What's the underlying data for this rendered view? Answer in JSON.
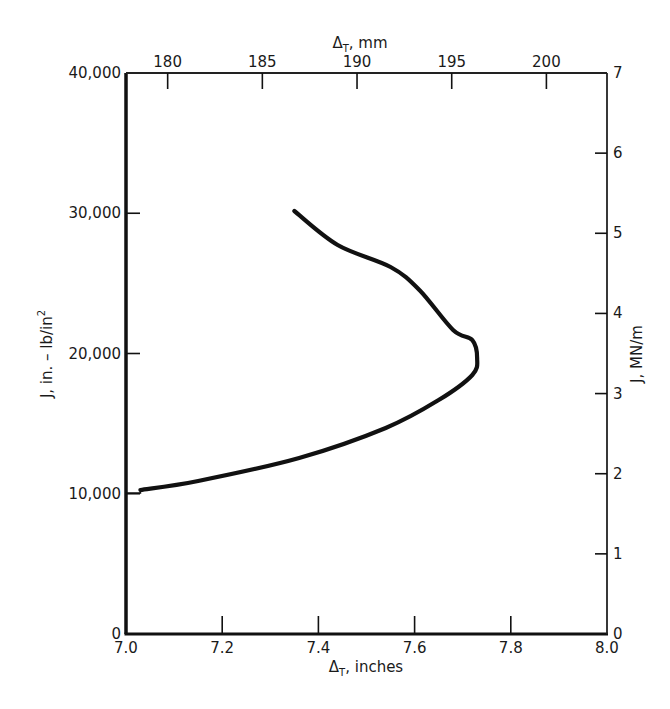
{
  "chart_data": {
    "type": "line",
    "title": "",
    "xlabel": "Δ_T, inches",
    "xlabel_main": "Δ",
    "xlabel_sub": "T",
    "xlabel_unit": ", inches",
    "ylabel": "J, in.-lb/in²",
    "ylabel_text": "J, in. – lb/in",
    "ylabel_sup": "2",
    "x2label": "Δ_T, mm",
    "x2label_main": "Δ",
    "x2label_sub": "T",
    "x2label_unit": ", mm",
    "y2label": "J, MN/m",
    "xlim": [
      7.0,
      8.0
    ],
    "ylim": [
      0,
      40000
    ],
    "x2lim": [
      177.8,
      203.2
    ],
    "y2lim": [
      0,
      7
    ],
    "grid": false,
    "legend": null,
    "x_ticks": [
      "7.0",
      "7.2",
      "7.4",
      "7.6",
      "7.8",
      "8.0"
    ],
    "x_tick_values": [
      7.0,
      7.2,
      7.4,
      7.6,
      7.8,
      8.0
    ],
    "y_ticks": [
      "0",
      "10,000",
      "20,000",
      "30,000",
      "40,000"
    ],
    "y_tick_values": [
      0,
      10000,
      20000,
      30000,
      40000
    ],
    "x2_ticks": [
      "180",
      "185",
      "190",
      "195",
      "200"
    ],
    "x2_tick_values": [
      180,
      185,
      190,
      195,
      200
    ],
    "y2_ticks": [
      "0",
      "1",
      "2",
      "3",
      "4",
      "5",
      "6",
      "7"
    ],
    "y2_tick_values": [
      0,
      1,
      2,
      3,
      4,
      5,
      6,
      7
    ],
    "series": [
      {
        "name": "J vs Δ_T",
        "color": "#111111",
        "x": [
          7.0,
          7.03,
          7.15,
          7.36,
          7.54,
          7.65,
          7.72,
          7.73,
          7.72,
          7.68,
          7.61,
          7.55,
          7.44,
          7.35
        ],
        "y": [
          10050,
          10270,
          10910,
          12550,
          14690,
          16680,
          18470,
          19680,
          20960,
          21680,
          24530,
          26170,
          27740,
          30160
        ]
      }
    ]
  }
}
